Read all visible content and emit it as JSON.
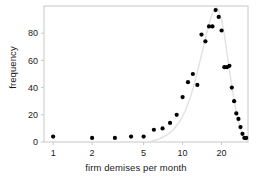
{
  "chart_data": {
    "type": "scatter",
    "title": "",
    "xlabel": "firm demises per month",
    "ylabel": "frequency",
    "xscale": "log",
    "yscale": "linear",
    "xlim": [
      0.85,
      32
    ],
    "ylim": [
      0,
      100
    ],
    "grid": false,
    "legend": null,
    "xticks": [
      1,
      2,
      5,
      10,
      20
    ],
    "xtick_labels": [
      "1",
      "2",
      "5",
      "10",
      "20"
    ],
    "yticks": [
      0,
      20,
      40,
      60,
      80
    ],
    "ytick_labels": [
      "0",
      "20",
      "40",
      "60",
      "80"
    ],
    "marker": "filled-circle",
    "marker_color": "#000000",
    "fit_curve_color": "#e2e2e2",
    "frame_color": "#c8c8c8",
    "x": [
      1,
      2,
      3,
      4,
      5,
      6,
      7,
      8,
      9,
      10,
      11,
      12,
      13,
      14,
      15,
      16,
      17,
      18,
      19,
      20,
      21,
      22,
      23,
      24,
      25,
      26,
      27,
      28,
      29,
      30,
      31
    ],
    "y": [
      4,
      3,
      3,
      4,
      4,
      9,
      10,
      14,
      20,
      33,
      44,
      50,
      42,
      79,
      74,
      85,
      85,
      97,
      92,
      82,
      55,
      55,
      56,
      40,
      30,
      21,
      17,
      11,
      6,
      3,
      3
    ],
    "series": [
      {
        "name": "observed frequency",
        "points": [
          [
            1,
            4
          ],
          [
            2,
            3
          ],
          [
            3,
            3
          ],
          [
            4,
            4
          ],
          [
            5,
            4
          ],
          [
            6,
            9
          ],
          [
            7,
            10
          ],
          [
            8,
            14
          ],
          [
            9,
            20
          ],
          [
            10,
            33
          ],
          [
            11,
            44
          ],
          [
            12,
            50
          ],
          [
            13,
            42
          ],
          [
            14,
            79
          ],
          [
            15,
            74
          ],
          [
            16,
            85
          ],
          [
            17,
            85
          ],
          [
            18,
            97
          ],
          [
            19,
            92
          ],
          [
            20,
            82
          ],
          [
            21,
            55
          ],
          [
            22,
            55
          ],
          [
            23,
            56
          ],
          [
            24,
            40
          ],
          [
            25,
            30
          ],
          [
            26,
            21
          ],
          [
            27,
            17
          ],
          [
            28,
            11
          ],
          [
            29,
            6
          ],
          [
            30,
            3
          ],
          [
            31,
            3
          ]
        ]
      },
      {
        "name": "fitted curve",
        "style": "line",
        "points": [
          [
            5.5,
            0
          ],
          [
            6.5,
            2
          ],
          [
            7.5,
            5
          ],
          [
            8.5,
            9
          ],
          [
            9.5,
            15
          ],
          [
            10.5,
            23
          ],
          [
            11.5,
            33
          ],
          [
            12.5,
            45
          ],
          [
            13.5,
            58
          ],
          [
            14.5,
            70
          ],
          [
            15.5,
            82
          ],
          [
            16.5,
            91
          ],
          [
            17.5,
            97
          ],
          [
            18.2,
            99
          ],
          [
            19,
            97
          ],
          [
            20,
            90
          ],
          [
            21,
            79
          ],
          [
            22,
            66
          ],
          [
            23,
            53
          ],
          [
            24,
            41
          ],
          [
            25,
            31
          ],
          [
            26,
            22
          ],
          [
            27,
            15
          ],
          [
            28,
            10
          ],
          [
            29,
            6
          ],
          [
            30,
            3
          ],
          [
            31,
            1
          ]
        ]
      }
    ]
  }
}
